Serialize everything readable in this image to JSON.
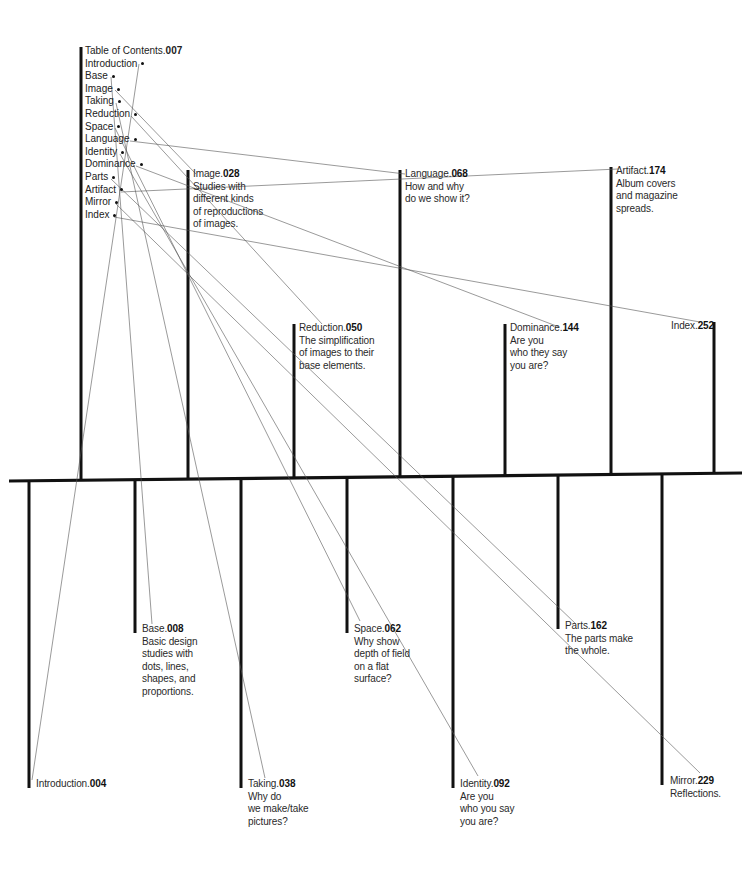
{
  "toc": {
    "title": "Table of Contents",
    "title_page": "007",
    "items": [
      "Introduction",
      "Base",
      "Image",
      "Taking",
      "Reduction",
      "Space",
      "Language",
      "Identity",
      "Dominance",
      "Parts",
      "Artifact",
      "Mirror",
      "Index"
    ]
  },
  "upper_entries": [
    {
      "name": "Image",
      "page": "028",
      "desc": [
        "Studies with",
        "different kinds",
        "of reproductions",
        "of images."
      ]
    },
    {
      "name": "Reduction",
      "page": "050",
      "desc": [
        "The simplification",
        "of images to their",
        "base elements."
      ]
    },
    {
      "name": "Language",
      "page": "068",
      "desc": [
        "How and why",
        "do we show it?"
      ]
    },
    {
      "name": "Dominance",
      "page": "144",
      "desc": [
        "Are you",
        "who they say",
        "you are?"
      ]
    },
    {
      "name": "Artifact",
      "page": "174",
      "desc": [
        "Album covers",
        "and magazine",
        "spreads."
      ]
    },
    {
      "name": "Index",
      "page": "252",
      "desc": []
    }
  ],
  "lower_entries": [
    {
      "name": "Introduction",
      "page": "004",
      "desc": []
    },
    {
      "name": "Base",
      "page": "008",
      "desc": [
        "Basic design",
        "studies with",
        "dots, lines,",
        "shapes, and",
        "proportions."
      ]
    },
    {
      "name": "Taking",
      "page": "038",
      "desc": [
        "Why do",
        "we make/take",
        "pictures?"
      ]
    },
    {
      "name": "Space",
      "page": "062",
      "desc": [
        "Why show",
        "depth of field",
        "on a flat",
        "surface?"
      ]
    },
    {
      "name": "Identity",
      "page": "092",
      "desc": [
        "Are you",
        "who you say",
        "you are?"
      ]
    },
    {
      "name": "Parts",
      "page": "162",
      "desc": [
        "The parts make",
        "the whole."
      ]
    },
    {
      "name": "Mirror",
      "page": "229",
      "desc": [
        "Reflections."
      ]
    }
  ]
}
